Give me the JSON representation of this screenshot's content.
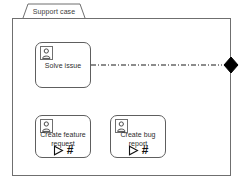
{
  "diagram": {
    "title": "Support case",
    "type": "uml-package-frame",
    "stroke_color": "#5e5e5e",
    "accent_color": "#000000",
    "background": "#ffffff"
  },
  "nodes": [
    {
      "id": "solve-issue",
      "label": "Solve issue",
      "icon": "actor-icon",
      "has_glyphs": false,
      "play_glyph": "",
      "hash_glyph": ""
    },
    {
      "id": "create-feature-request",
      "label": "Create feature request",
      "icon": "actor-icon",
      "has_glyphs": true,
      "play_glyph": "play-triangle-icon",
      "hash_glyph": "#"
    },
    {
      "id": "create-bug-report",
      "label": "Create bug report",
      "icon": "actor-icon",
      "has_glyphs": true,
      "play_glyph": "play-triangle-icon",
      "hash_glyph": "#"
    }
  ],
  "connector": {
    "from": "solve-issue",
    "to": "frame-right-edge",
    "style": "dash-dot",
    "endpoint": "filled-diamond"
  }
}
